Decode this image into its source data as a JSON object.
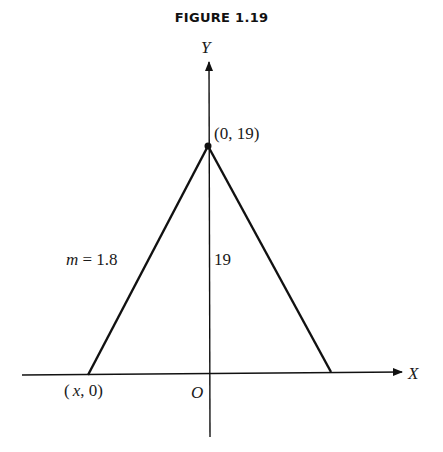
{
  "figure": {
    "title": "FIGURE 1.19"
  },
  "diagram": {
    "axes": {
      "x_label": "X",
      "y_label": "Y",
      "origin_label": "O"
    },
    "apex": {
      "label": "(0, 19)"
    },
    "left_base": {
      "label_var": "x",
      "label_rest": ", 0)",
      "label_open": "("
    },
    "slope_label": {
      "var": "m",
      "rest": " = 1.8"
    },
    "height_label": "19"
  }
}
